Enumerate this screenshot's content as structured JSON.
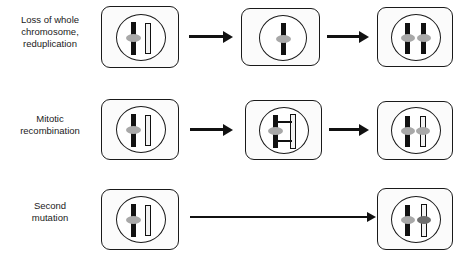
{
  "figure": {
    "background_color": "#ffffff",
    "width": 470,
    "height": 257
  },
  "colors": {
    "outline": "#1a1a1a",
    "cell_fill": "#fbfbfb",
    "nucleus_fill": "#ffffff",
    "chromosome_dark": "#111111",
    "chromosome_light": "#f2f2f2",
    "centromere_grey": "#a8a8a8",
    "centromere_dark_grey": "#6e6e6e",
    "arrow": "#111111",
    "text": "#1a1a1a"
  },
  "rows": [
    {
      "id": "loss-reduplication",
      "label_lines": [
        "Loss of whole",
        "chromosome,",
        "reduplication"
      ],
      "label_text": "Loss of whole chromosome, reduplication",
      "stages": [
        {
          "id": "row1-stage1",
          "name": "heterozygous-cell",
          "chromosomes": [
            {
              "shade": "dark",
              "centromere": "grey"
            },
            {
              "shade": "light",
              "centromere": "none"
            }
          ]
        },
        {
          "id": "row1-stage2",
          "name": "chromosome-lost-cell",
          "chromosomes": [
            {
              "shade": "dark",
              "centromere": "grey"
            }
          ]
        },
        {
          "id": "row1-stage3",
          "name": "reduplicated-cell",
          "chromosomes": [
            {
              "shade": "dark",
              "centromere": "grey"
            },
            {
              "shade": "dark",
              "centromere": "grey"
            }
          ]
        }
      ],
      "arrows": [
        "short",
        "short"
      ]
    },
    {
      "id": "mitotic-recombination",
      "label_lines": [
        "Mitotic",
        "recombination"
      ],
      "label_text": "Mitotic recombination",
      "stages": [
        {
          "id": "row2-stage1",
          "name": "heterozygous-cell",
          "chromosomes": [
            {
              "shade": "dark",
              "centromere": "grey"
            },
            {
              "shade": "light",
              "centromere": "none"
            }
          ]
        },
        {
          "id": "row2-stage2",
          "name": "crossover-cell",
          "chromosomes": [
            {
              "shade": "dark",
              "centromere": "grey"
            },
            {
              "shade": "light",
              "centromere": "none"
            }
          ],
          "crossover": true
        },
        {
          "id": "row2-stage3",
          "name": "recombinant-cell",
          "chromosomes": [
            {
              "shade": "dark",
              "centromere": "grey"
            },
            {
              "shade": "segmented-light",
              "centromere": "grey"
            }
          ]
        }
      ],
      "arrows": [
        "short",
        "short"
      ]
    },
    {
      "id": "second-mutation",
      "label_lines": [
        "Second",
        "mutation"
      ],
      "label_text": "Second mutation",
      "stages": [
        {
          "id": "row3-stage1",
          "name": "heterozygous-cell",
          "chromosomes": [
            {
              "shade": "dark",
              "centromere": "grey"
            },
            {
              "shade": "light",
              "centromere": "none"
            }
          ]
        },
        {
          "id": "row3-stage3",
          "name": "second-hit-cell",
          "chromosomes": [
            {
              "shade": "dark",
              "centromere": "grey"
            },
            {
              "shade": "light",
              "centromere": "dark-grey"
            }
          ]
        }
      ],
      "arrows": [
        "long"
      ]
    }
  ]
}
